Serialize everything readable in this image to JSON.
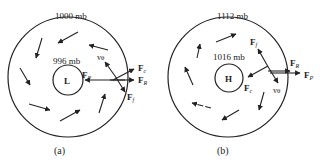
{
  "panels": [
    {
      "id": "a",
      "caption": "(a)",
      "outer_pressure": "1000 mb",
      "inner_pressure": "996 mb",
      "center_label": "L",
      "forces": {
        "pressure": "F",
        "pressure_sub": "P",
        "coriolis": "F",
        "coriolis_sub": "c",
        "resultant": "F",
        "resultant_sub": "R",
        "friction": "F",
        "friction_sub": "f",
        "velocity": "v",
        "velocity_sub": "θ"
      }
    },
    {
      "id": "b",
      "caption": "(b)",
      "outer_pressure": "1112 mb",
      "inner_pressure": "1016 mb",
      "center_label": "H",
      "forces": {
        "pressure": "F",
        "pressure_sub": "P",
        "coriolis": "F",
        "coriolis_sub": "c",
        "resultant": "F",
        "resultant_sub": "R",
        "friction": "F",
        "friction_sub": "f",
        "velocity": "v",
        "velocity_sub": "θ"
      }
    }
  ]
}
